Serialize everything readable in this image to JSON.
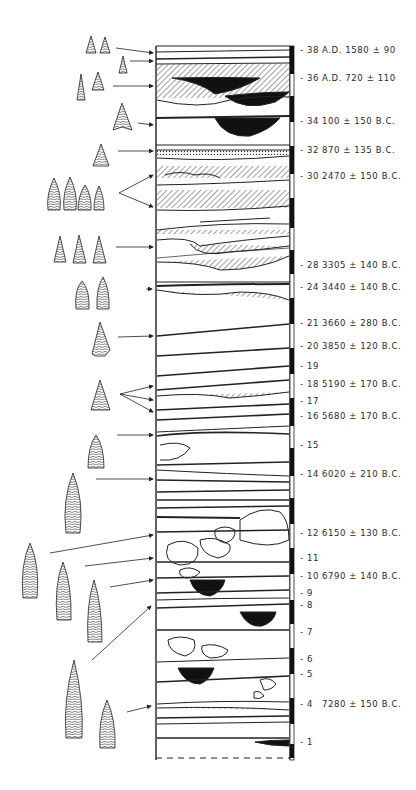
{
  "figure": {
    "type": "stratigraphic-profile"
  },
  "strata_labels": [
    {
      "layer": "38",
      "date": "A.D. 1580 ± 90",
      "y": 51
    },
    {
      "layer": "36",
      "date": "A.D. 720 ± 110",
      "y": 79
    },
    {
      "layer": "34",
      "date": "100 ± 150 B.C.",
      "y": 122
    },
    {
      "layer": "32",
      "date": "870 ± 135 B.C.",
      "y": 151
    },
    {
      "layer": "30",
      "date": "2470 ± 150 B.C.",
      "y": 177
    },
    {
      "layer": "28",
      "date": "3305 ± 140 B.C.",
      "y": 266
    },
    {
      "layer": "24",
      "date": "3440 ± 140 B.C.",
      "y": 288
    },
    {
      "layer": "21",
      "date": "3660 ± 280 B.C.",
      "y": 324
    },
    {
      "layer": "20",
      "date": "3850 ± 120 B.C.",
      "y": 347
    },
    {
      "layer": "19",
      "date": "",
      "y": 367
    },
    {
      "layer": "18",
      "date": "5190 ± 170 B.C.",
      "y": 385
    },
    {
      "layer": "17",
      "date": "",
      "y": 402
    },
    {
      "layer": "16",
      "date": "5680 ± 170 B.C.",
      "y": 417
    },
    {
      "layer": "15",
      "date": "",
      "y": 446
    },
    {
      "layer": "14",
      "date": "6020 ± 210 B.C.",
      "y": 475
    },
    {
      "layer": "12",
      "date": "6150 ± 130 B.C.",
      "y": 534
    },
    {
      "layer": "11",
      "date": "",
      "y": 559
    },
    {
      "layer": "10",
      "date": "6790 ± 140 B.C.",
      "y": 577
    },
    {
      "layer": "9",
      "date": "",
      "y": 594
    },
    {
      "layer": "8",
      "date": "",
      "y": 606
    },
    {
      "layer": "7",
      "date": "",
      "y": 633
    },
    {
      "layer": "6",
      "date": "",
      "y": 660
    },
    {
      "layer": "5",
      "date": "",
      "y": 675
    },
    {
      "layer": "4",
      "date": "7280 ± 150 B.C.",
      "y": 705
    },
    {
      "layer": "1",
      "date": "",
      "y": 743
    }
  ],
  "projectile_point_groups": [
    {
      "id": "g1",
      "count": 2,
      "target_layer": "38"
    },
    {
      "id": "g2",
      "count": 1,
      "target_layer": "38"
    },
    {
      "id": "g3",
      "count": 2,
      "target_layer": "36"
    },
    {
      "id": "g4",
      "count": 1,
      "target_layer": "34"
    },
    {
      "id": "g5",
      "count": 1,
      "target_layer": "32"
    },
    {
      "id": "g6",
      "count": 4,
      "target_layer": "30"
    },
    {
      "id": "g7",
      "count": 3,
      "target_layer": "28-30"
    },
    {
      "id": "g8",
      "count": 2,
      "target_layer": "24"
    },
    {
      "id": "g9",
      "count": 1,
      "target_layer": "21"
    },
    {
      "id": "g10",
      "count": 1,
      "target_layer": "17-18"
    },
    {
      "id": "g11",
      "count": 1,
      "target_layer": "16"
    },
    {
      "id": "g12",
      "count": 1,
      "target_layer": "14"
    },
    {
      "id": "g13",
      "count": 1,
      "target_layer": "12"
    },
    {
      "id": "g14",
      "count": 1,
      "target_layer": "11"
    },
    {
      "id": "g15",
      "count": 1,
      "target_layer": "10"
    },
    {
      "id": "g16",
      "count": 1,
      "target_layer": "8"
    },
    {
      "id": "g17",
      "count": 1,
      "target_layer": "4"
    }
  ],
  "colors": {
    "ink": "#1a1a1a",
    "paper": "#ffffff",
    "hatch": "#555555"
  }
}
